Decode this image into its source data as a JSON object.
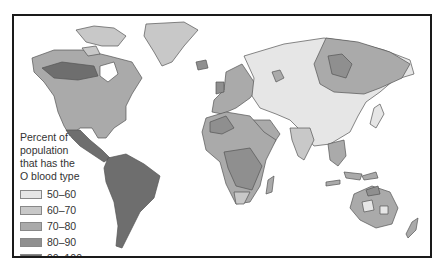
{
  "map": {
    "subject": "Percent of population with O blood type",
    "colors": {
      "ocean": "#ffffff",
      "outline": "#555555",
      "50-60": "#e6e6e6",
      "60-70": "#c8c8c8",
      "70-80": "#aaaaaa",
      "80-90": "#8f8f8f",
      "90-100": "#6e6e6e"
    }
  },
  "legend": {
    "title_lines": [
      "Percent of",
      "population",
      "that has the",
      "O blood type"
    ],
    "items": [
      {
        "label": "50–60",
        "color": "#e6e6e6"
      },
      {
        "label": "60–70",
        "color": "#c8c8c8"
      },
      {
        "label": "70–80",
        "color": "#aaaaaa"
      },
      {
        "label": "80–90",
        "color": "#8f8f8f"
      },
      {
        "label": "90–100",
        "color": "#6e6e6e"
      }
    ]
  }
}
